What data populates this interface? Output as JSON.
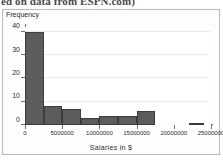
{
  "caption": {
    "text": "ed on data from ESPN.com)"
  },
  "chart_data": {
    "type": "bar",
    "title": "",
    "subtitle": "",
    "xlabel": "Salaries in $",
    "ylabel": "Frequency",
    "bin_width": 2500000,
    "xlim": [
      0,
      25000000
    ],
    "ylim": [
      0,
      42
    ],
    "grid": true,
    "legend": null,
    "xticks": [
      0,
      5000000,
      10000000,
      15000000,
      20000000,
      25000000
    ],
    "xticklabels": [
      "0",
      "5000000",
      "10000000",
      "15000000",
      "20000000",
      "25000000"
    ],
    "yticks": [
      0,
      10,
      20,
      30,
      40
    ],
    "yticklabels": [
      "0",
      "10",
      "20",
      "30",
      "40"
    ],
    "bars": [
      {
        "bin_start": 0,
        "bin_end": 2500000,
        "value": 40
      },
      {
        "bin_start": 2500000,
        "bin_end": 5000000,
        "value": 8
      },
      {
        "bin_start": 5000000,
        "bin_end": 7500000,
        "value": 7
      },
      {
        "bin_start": 7500000,
        "bin_end": 10000000,
        "value": 3
      },
      {
        "bin_start": 10000000,
        "bin_end": 12500000,
        "value": 4
      },
      {
        "bin_start": 12500000,
        "bin_end": 15000000,
        "value": 4
      },
      {
        "bin_start": 15000000,
        "bin_end": 17500000,
        "value": 6
      },
      {
        "bin_start": 17500000,
        "bin_end": 20000000,
        "value": 0
      },
      {
        "bin_start": 20000000,
        "bin_end": 22000000,
        "value": 0
      },
      {
        "bin_start": 22000000,
        "bin_end": 24000000,
        "value": 1
      }
    ],
    "bar_color": "#5c5c5c",
    "bar_edge_color": "#3c3c3c",
    "plot_background": "#ffffff",
    "grid_color": "#ececec",
    "axis_color": "#6e6e6e"
  }
}
